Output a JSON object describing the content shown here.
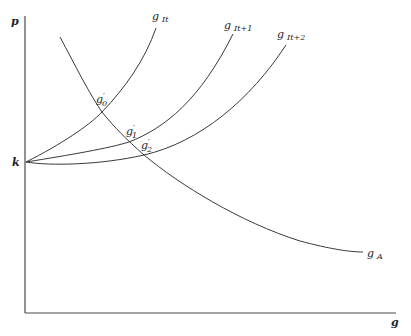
{
  "diagram": {
    "axes": {
      "y_label": "p",
      "x_label": "g",
      "origin_label": "k"
    },
    "curves": [
      {
        "id": "g_It",
        "label_main": "g",
        "label_sub": "It"
      },
      {
        "id": "g_It1",
        "label_main": "g",
        "label_sub": "It+1"
      },
      {
        "id": "g_It2",
        "label_main": "g",
        "label_sub": "It+2"
      },
      {
        "id": "g_A",
        "label_main": "g",
        "label_sub": "A"
      }
    ],
    "intersections": [
      {
        "id": "g0",
        "label_main": "g",
        "label_prime": "′",
        "label_sub": "0"
      },
      {
        "id": "g1",
        "label_main": "g",
        "label_prime": "′",
        "label_sub": "1"
      },
      {
        "id": "g2",
        "label_main": "g",
        "label_prime": "′",
        "label_sub": "2"
      }
    ],
    "line_color": "#3a3a3a",
    "background": "#ffffff"
  }
}
